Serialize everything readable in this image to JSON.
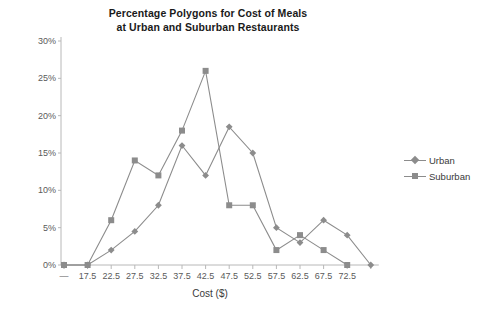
{
  "chart_data": {
    "type": "line",
    "title": "Percentage Polygons for Cost of Meals at Urban and Suburban Restaurants",
    "title_line1": "Percentage Polygons for Cost of Meals",
    "title_line2": "at Urban and Suburban Restaurants",
    "xlabel": "Cost ($)",
    "ylabel": "",
    "categories": [
      "—",
      "17.5",
      "22.5",
      "27.5",
      "32.5",
      "37.5",
      "42.5",
      "47.5",
      "52.5",
      "57.5",
      "62.5",
      "67.5",
      "72.5",
      ""
    ],
    "x_tick_labels": [
      "—",
      "17.5",
      "22.5",
      "27.5",
      "32.5",
      "37.5",
      "42.5",
      "47.5",
      "52.5",
      "57.5",
      "62.5",
      "67.5",
      "72.5"
    ],
    "y_tick_labels": [
      "0%",
      "5%",
      "10%",
      "15%",
      "20%",
      "25%",
      "30%"
    ],
    "y_tick_values": [
      0,
      5,
      10,
      15,
      20,
      25,
      30
    ],
    "ylim": [
      0,
      30
    ],
    "grid": false,
    "legend_position": "right",
    "series": [
      {
        "name": "Urban",
        "marker": "diamond",
        "color": "#8c8c8c",
        "values": [
          0,
          0,
          2,
          4.5,
          8,
          16,
          12,
          18.5,
          15,
          5,
          3,
          6,
          4,
          0
        ]
      },
      {
        "name": "Suburban",
        "marker": "square",
        "color": "#8c8c8c",
        "values": [
          0,
          0,
          6,
          14,
          12,
          18,
          26,
          8,
          8,
          2,
          4,
          2,
          0,
          null
        ]
      }
    ]
  },
  "legend": {
    "items": [
      {
        "label": "Urban",
        "marker": "diamond"
      },
      {
        "label": "Suburban",
        "marker": "square"
      }
    ]
  },
  "colors": {
    "series": "#8c8c8c",
    "axis": "#b8b8b8",
    "text": "#4a4a4a",
    "title": "#1a1a1a",
    "background": "#ffffff"
  }
}
